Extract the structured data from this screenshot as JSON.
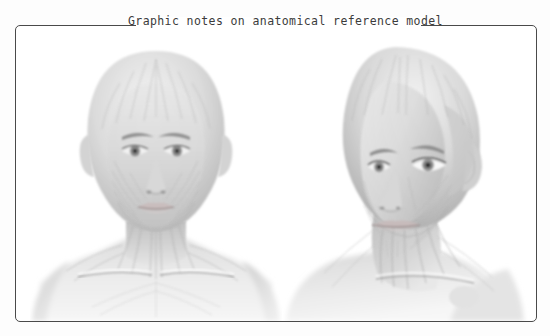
{
  "page": {
    "background_color": "#ffffff",
    "width": 550,
    "height": 336
  },
  "note_card": {
    "title": "Graphic notes on anatomical reference model",
    "border_color": "#4a4a4a",
    "title_color": "#3b3b3b",
    "background_color": "#ffffff"
  },
  "figures": [
    {
      "id": "anterior-view",
      "label": "Anterior (frontal) view of anatomical reference head",
      "view": "front",
      "subject": "bald female anatomical reference model",
      "visible_regions": [
        "cranium",
        "forehead",
        "brows",
        "eyes",
        "nose",
        "mouth",
        "chin",
        "neck",
        "clavicles",
        "shoulders",
        "upper chest"
      ],
      "rendering": "graphite pencil study with superficial facial muscle striations",
      "tone_range": [
        "#ffffff",
        "#8d8d8d"
      ]
    },
    {
      "id": "three-quarter-view",
      "label": "Three-quarter view of anatomical reference head",
      "view": "three-quarter",
      "subject": "bald female anatomical reference model",
      "visible_regions": [
        "cranium",
        "temporalis",
        "forehead",
        "eyes",
        "nose",
        "mouth",
        "jaw",
        "ear",
        "neck",
        "sternocleidomastoid",
        "clavicle",
        "shoulder"
      ],
      "rendering": "graphite pencil study with superficial facial muscle striations",
      "tone_range": [
        "#ffffff",
        "#8d8d8d"
      ]
    }
  ]
}
